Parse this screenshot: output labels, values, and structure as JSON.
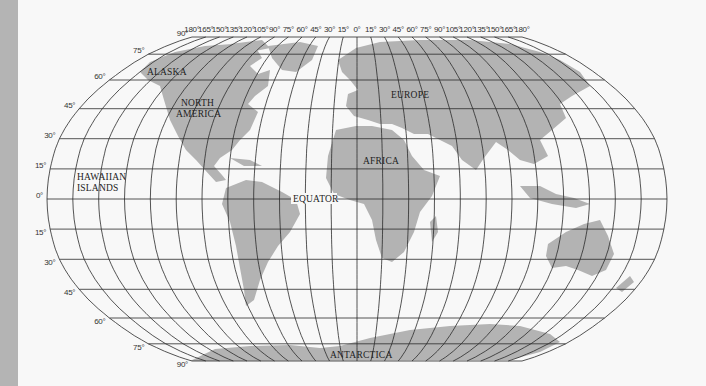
{
  "map": {
    "projection": "Robinson",
    "colors": {
      "land": "#b3b3b3",
      "grid": "#2a2a2a",
      "background": "#f8f8f8",
      "sidebar": "#b4b4b4"
    },
    "longitude_labels": [
      "180°",
      "165°",
      "150°",
      "135°",
      "120°",
      "105°",
      "90°",
      "75°",
      "60°",
      "45°",
      "30°",
      "15°",
      "0°",
      "15°",
      "30°",
      "45°",
      "60°",
      "75°",
      "90°",
      "105°",
      "120°",
      "135°",
      "150°",
      "165°",
      "180°"
    ],
    "latitude_labels_north": [
      "90°",
      "75°",
      "60°",
      "45°",
      "30°",
      "15°",
      "0°"
    ],
    "latitude_labels_south": [
      "15°",
      "30°",
      "45°",
      "60°",
      "75°",
      "90°"
    ],
    "region_labels": {
      "alaska": "ALASKA",
      "north_america_line1": "NORTH",
      "north_america_line2": "AMERICA",
      "europe": "EUROPE",
      "africa": "AFRICA",
      "hawaii_line1": "HAWAIIAN",
      "hawaii_line2": "ISLANDS",
      "equator": "EQUATOR",
      "antarctica": "ANTARCTICA"
    }
  }
}
